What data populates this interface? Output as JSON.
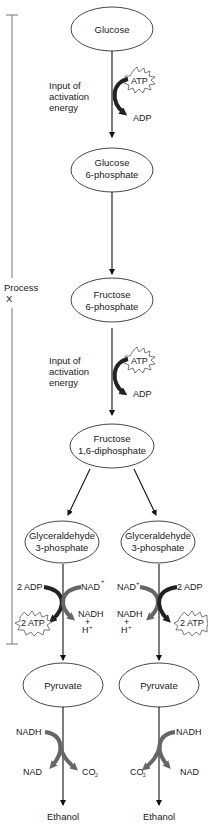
{
  "diagram": {
    "process_label": {
      "line1": "Process",
      "line2": "X"
    },
    "nodes": {
      "glucose": {
        "line1": "Glucose"
      },
      "g6p": {
        "line1": "Glucose",
        "line2": "6-phosphate"
      },
      "f6p": {
        "line1": "Fructose",
        "line2": "6-phosphate"
      },
      "f16dp": {
        "line1": "Fructose",
        "line2": "1,6-diphosphate"
      },
      "g3p_left": {
        "line1": "Glyceraldehyde",
        "line2": "3-phosphate"
      },
      "g3p_right": {
        "line1": "Glyceraldehyde",
        "line2": "3-phosphate"
      },
      "pyruvate_left": {
        "line1": "Pyruvate"
      },
      "pyruvate_right": {
        "line1": "Pyruvate"
      },
      "ethanol_left": {
        "line1": "Ethanol"
      },
      "ethanol_right": {
        "line1": "Ethanol"
      }
    },
    "step1": {
      "annotation": {
        "line1": "Input of",
        "line2": "activation",
        "line3": "energy"
      },
      "input": "ATP",
      "output": "ADP"
    },
    "step3": {
      "annotation": {
        "line1": "Input of",
        "line2": "activation",
        "line3": "energy"
      },
      "input": "ATP",
      "output": "ADP"
    },
    "left_branch": {
      "adp_in": "2 ADP",
      "atp_out": "2 ATP",
      "nad_in": "NAD",
      "nad_sup": "+",
      "nadh_out": "NADH",
      "plus": "+",
      "h": "H",
      "h_sup": "+"
    },
    "right_branch": {
      "adp_in": "2 ADP",
      "atp_out": "2 ATP",
      "nad_in": "NAD",
      "nad_sup": "+",
      "nadh_out": "NADH",
      "plus": "+",
      "h": "H",
      "h_sup": "+"
    },
    "left_ferment": {
      "nadh_in": "NADH",
      "nad_out": "NAD",
      "co2": "CO",
      "co2_sub": "2"
    },
    "right_ferment": {
      "nadh_in": "NADH",
      "nad_out": "NAD",
      "co2": "CO",
      "co2_sub": "2"
    },
    "colors": {
      "dark_curve": "#222222",
      "gray_curve": "#666666",
      "bracket": "#777777"
    }
  }
}
